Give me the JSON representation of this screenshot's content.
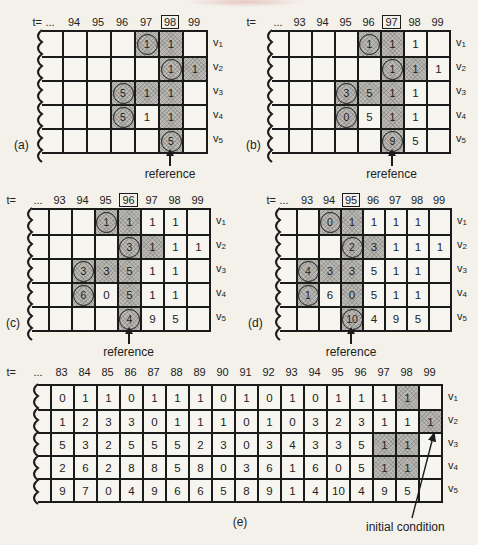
{
  "colors": {
    "paper": "#f3f1ea",
    "cell": "#f7f5ef",
    "shading": "#bcbab5",
    "line": "#1b1b1b",
    "text": "#222222"
  },
  "panels": [
    {
      "id": "a",
      "letter": "(a)",
      "t_label": "t=",
      "dots": "...",
      "columns": [
        "94",
        "95",
        "96",
        "97",
        "98",
        "99"
      ],
      "boxed_index": 4,
      "row_labels": [
        "v1",
        "v2",
        "v3",
        "v4",
        "v5"
      ],
      "values": [
        [
          "",
          "",
          "",
          "1",
          "1",
          ""
        ],
        [
          "",
          "",
          "",
          "",
          "1",
          "1"
        ],
        [
          "",
          "",
          "5",
          "1",
          "1",
          ""
        ],
        [
          "",
          "",
          "5",
          "1",
          "1",
          ""
        ],
        [
          "",
          "",
          "",
          "",
          "5",
          ""
        ]
      ],
      "circled": [
        [
          0,
          3
        ],
        [
          1,
          4
        ],
        [
          2,
          2
        ],
        [
          3,
          2
        ],
        [
          4,
          4
        ]
      ],
      "shaded": [
        [
          0,
          3
        ],
        [
          0,
          4
        ],
        [
          1,
          4
        ],
        [
          1,
          5
        ],
        [
          2,
          2
        ],
        [
          2,
          3
        ],
        [
          2,
          4
        ],
        [
          3,
          2
        ],
        [
          3,
          4
        ],
        [
          4,
          4
        ]
      ],
      "reference_label": "reference",
      "reference_index": 4
    },
    {
      "id": "b",
      "letter": "(b)",
      "t_label": "t=",
      "dots": "...",
      "columns": [
        "93",
        "94",
        "95",
        "96",
        "97",
        "98",
        "99"
      ],
      "boxed_index": 4,
      "row_labels": [
        "v1",
        "v2",
        "v3",
        "v4",
        "v5"
      ],
      "values": [
        [
          "",
          "",
          "",
          "1",
          "1",
          "1",
          ""
        ],
        [
          "",
          "",
          "",
          "",
          "1",
          "1",
          "1"
        ],
        [
          "",
          "",
          "3",
          "5",
          "1",
          "1",
          ""
        ],
        [
          "",
          "",
          "0",
          "5",
          "1",
          "1",
          ""
        ],
        [
          "",
          "",
          "",
          "",
          "9",
          "5",
          ""
        ]
      ],
      "circled": [
        [
          0,
          3
        ],
        [
          1,
          4
        ],
        [
          2,
          2
        ],
        [
          3,
          2
        ],
        [
          4,
          4
        ]
      ],
      "shaded": [
        [
          0,
          3
        ],
        [
          0,
          4
        ],
        [
          1,
          4
        ],
        [
          1,
          5
        ],
        [
          2,
          2
        ],
        [
          2,
          3
        ],
        [
          2,
          4
        ],
        [
          3,
          2
        ],
        [
          3,
          4
        ],
        [
          4,
          4
        ]
      ],
      "reference_label": "rerefence",
      "reference_index": 4
    },
    {
      "id": "c",
      "letter": "(c)",
      "t_label": "t=",
      "dots": "...",
      "columns": [
        "93",
        "94",
        "95",
        "96",
        "97",
        "98",
        "99"
      ],
      "boxed_index": 3,
      "row_labels": [
        "v1",
        "v2",
        "v3",
        "v4",
        "v5"
      ],
      "values": [
        [
          "",
          "",
          "1",
          "1",
          "1",
          "1",
          ""
        ],
        [
          "",
          "",
          "",
          "3",
          "1",
          "1",
          "1"
        ],
        [
          "",
          "3",
          "3",
          "5",
          "1",
          "1",
          ""
        ],
        [
          "",
          "6",
          "0",
          "5",
          "1",
          "1",
          ""
        ],
        [
          "",
          "",
          "",
          "4",
          "9",
          "5",
          ""
        ]
      ],
      "circled": [
        [
          0,
          2
        ],
        [
          1,
          3
        ],
        [
          2,
          1
        ],
        [
          3,
          1
        ],
        [
          4,
          3
        ]
      ],
      "shaded": [
        [
          0,
          2
        ],
        [
          0,
          3
        ],
        [
          1,
          3
        ],
        [
          1,
          4
        ],
        [
          2,
          1
        ],
        [
          2,
          2
        ],
        [
          2,
          3
        ],
        [
          3,
          1
        ],
        [
          3,
          3
        ],
        [
          4,
          3
        ]
      ],
      "reference_label": "reference",
      "reference_index": 3
    },
    {
      "id": "d",
      "letter": "(d)",
      "t_label": "t=",
      "dots": "...",
      "columns": [
        "93",
        "94",
        "95",
        "96",
        "97",
        "98",
        "99"
      ],
      "boxed_index": 2,
      "row_labels": [
        "v1",
        "v2",
        "v3",
        "v4",
        "v5"
      ],
      "values": [
        [
          "",
          "0",
          "1",
          "1",
          "1",
          "1",
          ""
        ],
        [
          "",
          "",
          "2",
          "3",
          "1",
          "1",
          "1"
        ],
        [
          "4",
          "3",
          "3",
          "5",
          "1",
          "1",
          ""
        ],
        [
          "1",
          "6",
          "0",
          "5",
          "1",
          "1",
          ""
        ],
        [
          "",
          "",
          "10",
          "4",
          "9",
          "5",
          ""
        ]
      ],
      "circled": [
        [
          0,
          1
        ],
        [
          1,
          2
        ],
        [
          2,
          0
        ],
        [
          3,
          0
        ],
        [
          4,
          2
        ]
      ],
      "shaded": [
        [
          0,
          1
        ],
        [
          0,
          2
        ],
        [
          1,
          2
        ],
        [
          1,
          3
        ],
        [
          2,
          0
        ],
        [
          2,
          1
        ],
        [
          2,
          2
        ],
        [
          3,
          0
        ],
        [
          3,
          2
        ],
        [
          4,
          2
        ]
      ],
      "reference_label": "reference",
      "reference_index": 2
    },
    {
      "id": "e",
      "letter": "(e)",
      "t_label": "t=",
      "dots": "...",
      "columns": [
        "83",
        "84",
        "85",
        "86",
        "87",
        "88",
        "89",
        "90",
        "91",
        "92",
        "93",
        "94",
        "95",
        "96",
        "97",
        "98",
        "99"
      ],
      "boxed_index": -1,
      "row_labels": [
        "v1",
        "v2",
        "v3",
        "v4",
        "v5"
      ],
      "values": [
        [
          "0",
          "1",
          "1",
          "0",
          "1",
          "1",
          "1",
          "0",
          "1",
          "0",
          "1",
          "0",
          "1",
          "1",
          "1",
          "1",
          ""
        ],
        [
          "1",
          "2",
          "3",
          "3",
          "0",
          "1",
          "1",
          "1",
          "0",
          "1",
          "0",
          "3",
          "2",
          "3",
          "1",
          "1",
          "1"
        ],
        [
          "5",
          "3",
          "2",
          "5",
          "5",
          "5",
          "2",
          "3",
          "0",
          "3",
          "4",
          "3",
          "3",
          "5",
          "1",
          "1",
          ""
        ],
        [
          "2",
          "6",
          "2",
          "8",
          "8",
          "5",
          "8",
          "0",
          "3",
          "6",
          "1",
          "6",
          "0",
          "5",
          "1",
          "1",
          ""
        ],
        [
          "9",
          "7",
          "0",
          "4",
          "9",
          "6",
          "6",
          "5",
          "8",
          "9",
          "1",
          "4",
          "10",
          "4",
          "9",
          "5",
          ""
        ]
      ],
      "circled": [],
      "shaded": [
        [
          0,
          15
        ],
        [
          1,
          16
        ],
        [
          2,
          14
        ],
        [
          2,
          15
        ],
        [
          3,
          14
        ],
        [
          3,
          15
        ]
      ],
      "annotation": {
        "label": "initial condition",
        "target_row": 1,
        "target_col": 16
      }
    }
  ]
}
